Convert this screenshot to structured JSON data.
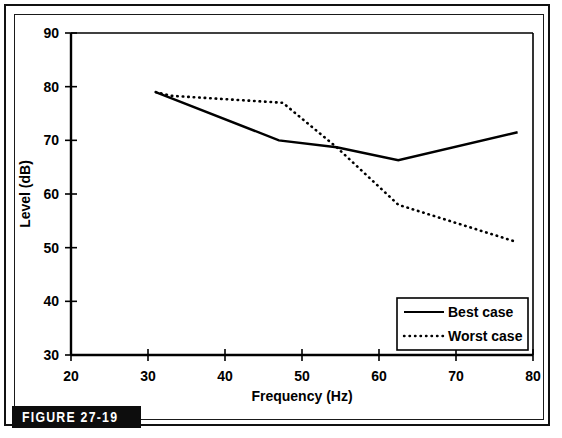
{
  "figure": {
    "caption_tag": "FIGURE 27-19"
  },
  "chart_data": {
    "type": "line",
    "title": "",
    "xlabel": "Frequency (Hz)",
    "ylabel": "Level (dB)",
    "xlim": [
      20,
      80
    ],
    "ylim": [
      30,
      90
    ],
    "xticks": [
      20,
      30,
      40,
      50,
      60,
      70,
      80
    ],
    "yticks": [
      30,
      40,
      50,
      60,
      70,
      80,
      90
    ],
    "grid": false,
    "legend_position": "lower right",
    "series": [
      {
        "name": "Best case",
        "style": "solid",
        "color": "#000000",
        "x": [
          31.0,
          47.0,
          54.5,
          62.5,
          78.0
        ],
        "y": [
          79.0,
          70.0,
          68.7,
          66.3,
          71.5
        ]
      },
      {
        "name": "Worst case",
        "style": "dotted",
        "color": "#000000",
        "x": [
          31.0,
          33.0,
          47.5,
          54.5,
          62.5,
          78.0
        ],
        "y": [
          79.0,
          78.3,
          77.0,
          68.7,
          58.0,
          51.0
        ]
      }
    ]
  },
  "axes": {
    "x_tick_labels": [
      "20",
      "30",
      "40",
      "50",
      "60",
      "70",
      "80"
    ],
    "y_tick_labels": [
      "30",
      "40",
      "50",
      "60",
      "70",
      "80",
      "90"
    ],
    "x_axis_title": "Frequency (Hz)",
    "y_axis_title": "Level (dB)"
  },
  "legend": {
    "entries": [
      {
        "label": "Best case",
        "style": "solid"
      },
      {
        "label": "Worst case",
        "style": "dotted"
      }
    ]
  },
  "colors": {
    "ink": "#000000",
    "background": "#ffffff",
    "tag_background": "#0d0d0d",
    "tag_text": "#ffffff"
  }
}
